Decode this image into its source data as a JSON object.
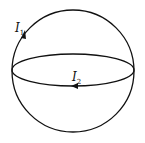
{
  "diagram": {
    "type": "sphere-with-current-loops",
    "colors": {
      "stroke": "#111111",
      "background": "#ffffff"
    },
    "labels": {
      "i1": {
        "symbol": "I",
        "subscript": "1"
      },
      "i2": {
        "symbol": "I",
        "subscript": "2"
      }
    },
    "elements": [
      {
        "name": "meridian-loop",
        "current": "I1",
        "direction": "upward along left side"
      },
      {
        "name": "equator-loop",
        "current": "I2",
        "direction": "leftward along front"
      }
    ]
  }
}
